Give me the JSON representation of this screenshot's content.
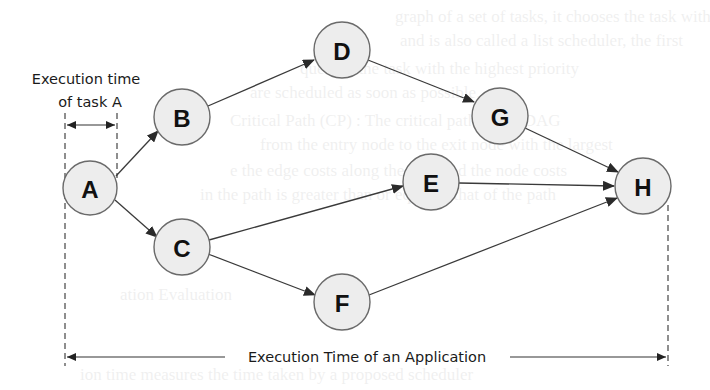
{
  "diagram": {
    "type": "task-dependency-dag",
    "nodes": [
      {
        "id": "A",
        "label": "A",
        "cx": 90,
        "cy": 188
      },
      {
        "id": "B",
        "label": "B",
        "cx": 182,
        "cy": 117
      },
      {
        "id": "C",
        "label": "C",
        "cx": 182,
        "cy": 247
      },
      {
        "id": "D",
        "label": "D",
        "cx": 342,
        "cy": 50
      },
      {
        "id": "E",
        "label": "E",
        "cx": 431,
        "cy": 182
      },
      {
        "id": "F",
        "label": "F",
        "cx": 342,
        "cy": 302
      },
      {
        "id": "G",
        "label": "G",
        "cx": 500,
        "cy": 116
      },
      {
        "id": "H",
        "label": "H",
        "cx": 643,
        "cy": 186
      }
    ],
    "edges": [
      {
        "from": "A",
        "to": "B"
      },
      {
        "from": "A",
        "to": "C"
      },
      {
        "from": "B",
        "to": "D"
      },
      {
        "from": "D",
        "to": "G"
      },
      {
        "from": "G",
        "to": "H"
      },
      {
        "from": "C",
        "to": "E"
      },
      {
        "from": "E",
        "to": "H"
      },
      {
        "from": "C",
        "to": "F"
      },
      {
        "from": "F",
        "to": "H"
      }
    ],
    "node_radius": 28,
    "colors": {
      "node_fill": "#ededed",
      "node_stroke": "#6a6a6a",
      "edge": "#3a3a3a",
      "text": "#111111"
    }
  },
  "annotations": {
    "task_time": {
      "line1": "Execution time",
      "line2": "of task A"
    },
    "app_time": {
      "label": "Execution Time of an Application"
    }
  }
}
